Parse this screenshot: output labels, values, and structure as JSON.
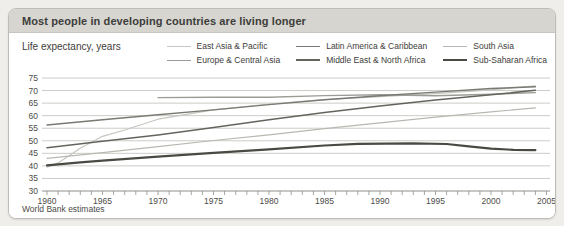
{
  "header": {
    "background": "#d6d5d0",
    "text_color": "#3d3d3a"
  },
  "chart_data": {
    "type": "line",
    "title": "Most people in developing countries are living longer",
    "ylabel": "Life expectancy, years",
    "xlabel": "",
    "source_note": "World Bank estimates",
    "xlim": [
      1960,
      2005
    ],
    "ylim": [
      30,
      75
    ],
    "x_tick_labels": [
      "1960",
      "1965",
      "1970",
      "1975",
      "1980",
      "1985",
      "1990",
      "1995",
      "2000",
      "2005"
    ],
    "y_tick_labels": [
      "30",
      "35",
      "40",
      "45",
      "50",
      "55",
      "60",
      "65",
      "70",
      "75"
    ],
    "minor_x_ticks": "every year",
    "grid": "horizontal",
    "legend_position": "top-right, two rows",
    "legend_order": [
      "East Asia & Pacific",
      "Latin America & Caribbean",
      "South Asia",
      "Europe & Central Asia",
      "Middle East & North Africa",
      "Sub-Saharan Africa"
    ],
    "colors": {
      "gridline": "#cccbc6",
      "axis_line": "#8f8f8a",
      "tick": "#8f8f8a",
      "axis_label": "#4c4c48"
    },
    "series": [
      {
        "name": "East Asia & Pacific",
        "color": "#c6c6c1",
        "stroke_width": 1.2,
        "points": [
          [
            1960,
            39.5
          ],
          [
            1961,
            41.2
          ],
          [
            1963,
            47.0
          ],
          [
            1965,
            51.8
          ],
          [
            1967,
            54.3
          ],
          [
            1970,
            58.6
          ],
          [
            1975,
            62.3
          ],
          [
            1980,
            64.6
          ],
          [
            1985,
            66.4
          ],
          [
            1990,
            67.6
          ],
          [
            1995,
            68.8
          ],
          [
            2000,
            70.3
          ],
          [
            2004,
            71.9
          ]
        ]
      },
      {
        "name": "Europe & Central Asia",
        "color": "#9c9c97",
        "stroke_width": 1.4,
        "points": [
          [
            1970,
            67.2
          ],
          [
            1975,
            67.3
          ],
          [
            1980,
            67.3
          ],
          [
            1985,
            68.0
          ],
          [
            1990,
            68.3
          ],
          [
            1995,
            67.9
          ],
          [
            2000,
            68.5
          ],
          [
            2004,
            69.2
          ]
        ]
      },
      {
        "name": "Latin America & Caribbean",
        "color": "#7a7a74",
        "stroke_width": 1.4,
        "points": [
          [
            1960,
            56.3
          ],
          [
            1965,
            58.4
          ],
          [
            1970,
            60.4
          ],
          [
            1975,
            62.3
          ],
          [
            1980,
            64.4
          ],
          [
            1985,
            66.3
          ],
          [
            1990,
            67.9
          ],
          [
            1995,
            69.4
          ],
          [
            2000,
            70.8
          ],
          [
            2004,
            71.5
          ]
        ]
      },
      {
        "name": "Middle East & North Africa",
        "color": "#64645f",
        "stroke_width": 1.5,
        "points": [
          [
            1960,
            47.2
          ],
          [
            1965,
            49.8
          ],
          [
            1970,
            52.3
          ],
          [
            1975,
            55.3
          ],
          [
            1980,
            58.4
          ],
          [
            1985,
            61.3
          ],
          [
            1990,
            63.9
          ],
          [
            1995,
            66.2
          ],
          [
            2000,
            68.3
          ],
          [
            2004,
            70.1
          ]
        ]
      },
      {
        "name": "South Asia",
        "color": "#b8b8b3",
        "stroke_width": 1.2,
        "points": [
          [
            1960,
            43.0
          ],
          [
            1965,
            45.3
          ],
          [
            1970,
            47.7
          ],
          [
            1975,
            50.1
          ],
          [
            1980,
            52.4
          ],
          [
            1985,
            54.8
          ],
          [
            1990,
            57.1
          ],
          [
            1995,
            59.4
          ],
          [
            2000,
            61.5
          ],
          [
            2004,
            63.1
          ]
        ]
      },
      {
        "name": "Sub-Saharan Africa",
        "color": "#4a4a44",
        "stroke_width": 2.2,
        "points": [
          [
            1960,
            40.2
          ],
          [
            1963,
            41.4
          ],
          [
            1965,
            42.1
          ],
          [
            1970,
            43.7
          ],
          [
            1975,
            45.2
          ],
          [
            1980,
            46.6
          ],
          [
            1985,
            48.1
          ],
          [
            1988,
            48.8
          ],
          [
            1993,
            49.0
          ],
          [
            1996,
            48.7
          ],
          [
            1998,
            47.8
          ],
          [
            2000,
            46.9
          ],
          [
            2002,
            46.4
          ],
          [
            2004,
            46.3
          ]
        ]
      }
    ]
  }
}
